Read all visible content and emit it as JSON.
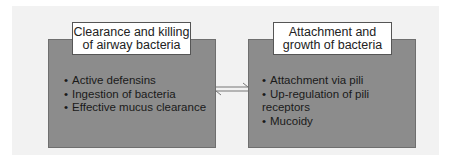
{
  "diagram": {
    "boxes": [
      {
        "title_lines": [
          "Clearance and killing",
          "of airway bacteria"
        ],
        "items": [
          "Active defensins",
          "Ingestion of bacteria",
          "Effective mucus clearance"
        ]
      },
      {
        "title_lines": [
          "Attachment and",
          "growth of bacteria"
        ],
        "items": [
          "Attachment via pili",
          "Up-regulation of pili receptors",
          "Mucoidy"
        ]
      }
    ],
    "connector": "double-headed-equilibrium-arrow",
    "colors": {
      "box_fill": "#8c8c8c",
      "label_fill": "#ffffff",
      "background": "#f2f2f2"
    }
  }
}
